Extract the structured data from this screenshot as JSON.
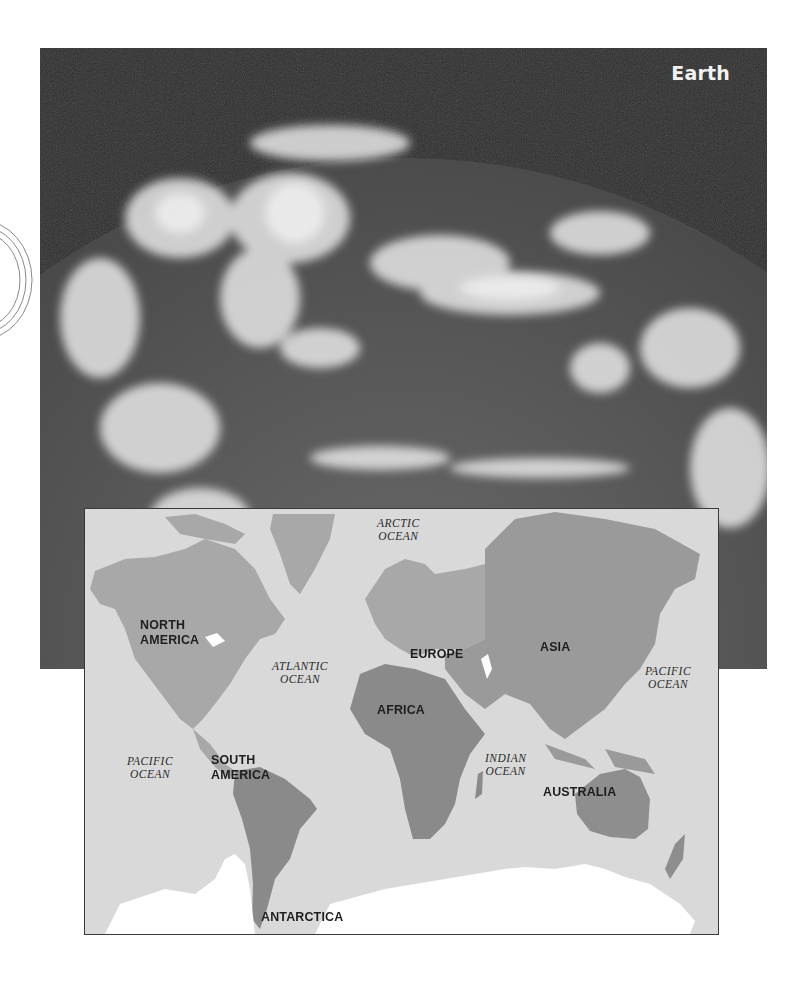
{
  "photo": {
    "title": "Earth",
    "description": "Satellite photograph of Earth showing cloud cover over the planet's curved limb against dark space"
  },
  "map": {
    "continents": [
      {
        "id": "north-america",
        "label_line1": "NORTH",
        "label_line2": "AMERICA",
        "shade": "#a8a8a8"
      },
      {
        "id": "south-america",
        "label_line1": "SOUTH",
        "label_line2": "AMERICA",
        "shade": "#8a8a8a"
      },
      {
        "id": "europe",
        "label_line1": "EUROPE",
        "shade": "#a8a8a8"
      },
      {
        "id": "asia",
        "label_line1": "ASIA",
        "shade": "#9a9a9a"
      },
      {
        "id": "africa",
        "label_line1": "AFRICA",
        "shade": "#8a8a8a"
      },
      {
        "id": "australia",
        "label_line1": "AUSTRALIA",
        "shade": "#8e8e8e"
      },
      {
        "id": "antarctica",
        "label_line1": "ANTARCTICA",
        "shade": "#ffffff"
      }
    ],
    "oceans": [
      {
        "id": "arctic",
        "line1": "ARCTIC",
        "line2": "OCEAN"
      },
      {
        "id": "atlantic",
        "line1": "ATLANTIC",
        "line2": "OCEAN"
      },
      {
        "id": "pacific-east",
        "line1": "PACIFIC",
        "line2": "OCEAN"
      },
      {
        "id": "pacific-west",
        "line1": "PACIFIC",
        "line2": "OCEAN"
      },
      {
        "id": "indian",
        "line1": "INDIAN",
        "line2": "OCEAN"
      }
    ],
    "colors": {
      "water": "#d9d9d9",
      "border": "#3a3a3a"
    }
  }
}
